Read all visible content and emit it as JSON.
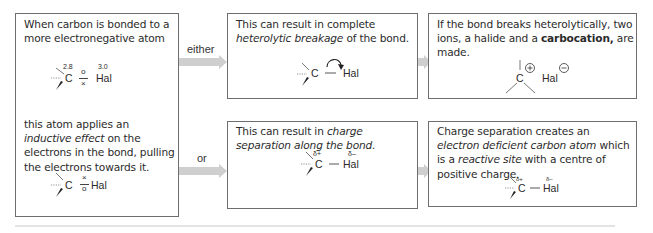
{
  "boxes": {
    "premise": {
      "top_text": "When carbon is bonded to a more electronegative atom",
      "bottom_text_parts": [
        "this atom applies an ",
        "inductive effect",
        " on the electrons in the bond, pulling the electrons towards it."
      ],
      "molecule_top": {
        "carbon": "C",
        "carbon_en": "2.8",
        "halogen": "Hal",
        "halogen_en": "3.0",
        "electron_top": "o",
        "electron_bottom": "×"
      },
      "molecule_bottom": {
        "carbon": "C",
        "halogen": "Hal",
        "electron_top": "×",
        "electron_bottom": "o"
      }
    },
    "heterolytic": {
      "text_parts": [
        "This can result in complete ",
        "heterolytic breakage",
        " of the bond."
      ],
      "molecule": {
        "carbon": "C",
        "bond": "—",
        "halogen": "Hal"
      }
    },
    "charge_separation": {
      "text_parts": [
        "This can result in ",
        "charge separation along the bond."
      ],
      "molecule": {
        "carbon": "C",
        "carbon_charge": "δ+",
        "bond": "—",
        "halogen": "Hal",
        "halogen_charge": "δ–"
      }
    },
    "carbocation": {
      "text_parts": [
        "If the bond breaks heterolytically, two ions, a halide and a ",
        "carbocation,",
        " are made."
      ],
      "molecule": {
        "carbon": "C",
        "carbon_charge": "+",
        "halogen": "Hal",
        "halogen_charge": "−"
      }
    },
    "reactive_site": {
      "text_parts": [
        "Charge separation creates an ",
        "electron deficient carbon atom",
        " which is a ",
        "reactive site",
        " with a centre of positive charge."
      ],
      "molecule": {
        "carbon": "C",
        "carbon_charge": "δ+",
        "bond": "—",
        "halogen": "Hal",
        "halogen_charge": "δ–"
      }
    }
  },
  "arrows": {
    "either_label": "either",
    "or_label": "or"
  },
  "colors": {
    "border": "#6e6e6e",
    "arrow": "#cfcfcf",
    "text": "#2b2b2b"
  }
}
